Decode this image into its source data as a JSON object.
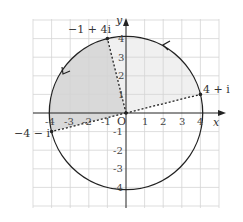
{
  "diagram": {
    "type": "argand-diagram",
    "axes": {
      "x_label": "x",
      "y_label": "y",
      "origin_label": "O",
      "x_ticks": [
        "-4",
        "-3",
        "-2",
        "-1",
        "1",
        "2",
        "3",
        "4"
      ],
      "y_ticks": [
        "4",
        "3",
        "2",
        "1",
        "-1",
        "-2",
        "-3",
        "-4"
      ]
    },
    "circle": {
      "center": "0",
      "radius": "√17",
      "direction": "counterclockwise"
    },
    "points": [
      {
        "label": "4 + i",
        "re": 4,
        "im": 1
      },
      {
        "label": "−1 + 4i",
        "re": -1,
        "im": 4
      },
      {
        "label": "−4 − i",
        "re": -4,
        "im": -1
      }
    ],
    "regions": [
      {
        "name": "sector-4+i-to-(-1+4i)",
        "shade": "light"
      },
      {
        "name": "sector-(-1+4i)-to-(-4-i)",
        "shade": "dark"
      }
    ],
    "colors": {
      "grid": "#d4d4d4",
      "axis": "#222222",
      "circle": "#222222",
      "shade_dark": "#d9d9d9",
      "shade_light": "#f0f0f0"
    }
  }
}
